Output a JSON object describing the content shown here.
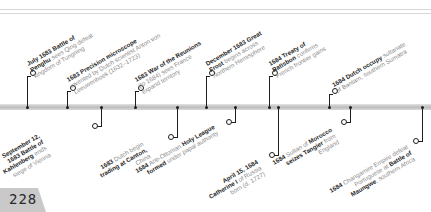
{
  "page": {
    "number": "228"
  },
  "colors": {
    "ink": "#1e1e1e",
    "muted": "#8a8a8a",
    "bar": "#c8c8c8",
    "tab": "#c9c9c9"
  },
  "events_above": [
    {
      "bold": "July 1683 Battle of",
      "bold2": "Penghu",
      "rest": " sees Qing defeat",
      "rest2": "kingdom of Tungning"
    },
    {
      "bold": "1683 Precision microscope",
      "rest": "invented by Dutch scientist Anton von",
      "rest2": "Leeuwenhoek (1632–1723)"
    },
    {
      "bold": "1683 War of the Reunions",
      "rest": "(to 1684) sees France",
      "rest2": "expand territory"
    },
    {
      "bold": "December 1683 Great",
      "bold2": "Frost",
      "rest": " begins across",
      "rest2": "Northern Hemisphere"
    },
    {
      "bold": "1684 Treaty of",
      "bold2": "Ratisbon",
      "rest": " confirms",
      "rest2": "French frontier gains"
    },
    {
      "bold": "1684 Dutch occupy",
      "rest": " sultanate",
      "rest2": "of Bantam, southern Sumatra"
    }
  ],
  "events_below": [
    {
      "line1": "September 12,",
      "line2": "1683 Battle of",
      "line3b": "Kahlenberg",
      "line3": " ends",
      "line4": "siege of Vienna"
    },
    {
      "line1b": "1683",
      "line1": " Dutch begin",
      "line2b": "trading at Canton,",
      "line3": "China"
    },
    {
      "line1b": "1684",
      "line1": " Anti-Ottoman ",
      "line1b2": "Holy League",
      "line2b": "formed",
      "line2": " under papal authority"
    },
    {
      "line1b": "April 15, 1684",
      "line2b": "Catherine I",
      "line2": " of Russia",
      "line3": "born (d. 1727)"
    },
    {
      "line1b": "1684",
      "line1": " Sultan of ",
      "line1b2": "Morocco",
      "line2b": "seizes Tangier",
      "line2": " from",
      "line3": "England"
    },
    {
      "line1": "1684 Changamire Empire defeat",
      "line1b": "1684",
      "line1r": " Changamire Empire defeat",
      "line2": "Portuguese at ",
      "line2b": "Battle of",
      "line3b": "Maungwe",
      "line3": ", southern Africa"
    }
  ]
}
